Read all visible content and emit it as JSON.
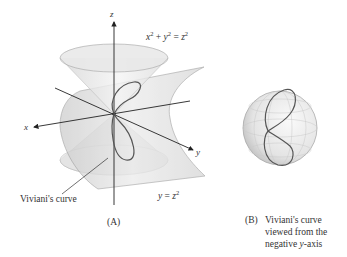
{
  "figure_a": {
    "axis_labels": {
      "x": "x",
      "y": "y",
      "z": "z"
    },
    "cone_equation": {
      "lhs_x": "x",
      "lhs_y": "y",
      "rhs_z": "z",
      "exp": "2",
      "plus": " + ",
      "eq": " = "
    },
    "cylinder_equation": {
      "lhs": "y",
      "eq": " = ",
      "rhs": "z",
      "exp": "2"
    },
    "curve_label": "Viviani's curve",
    "caption": "(A)"
  },
  "figure_b": {
    "caption_tag": "(B)",
    "caption_lines": [
      "Viviani's curve",
      "viewed from the",
      "negative "
    ],
    "caption_axis": "y",
    "caption_tail": "-axis"
  },
  "colors": {
    "surface_light": "#f0f0f0",
    "surface_mid": "#d9d9d9",
    "surface_dark": "#c4c4c4",
    "edge": "#9a9a9a",
    "curve": "#555555",
    "axis": "#222222",
    "text": "#333333"
  }
}
